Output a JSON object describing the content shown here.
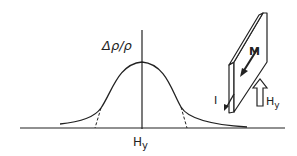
{
  "diagram": {
    "y_axis_label": "Δρ/ρ",
    "x_axis_label": "Hy",
    "x_axis_label_main": "H",
    "x_axis_label_sub": "y",
    "slab_labels": {
      "magnetization": "M",
      "current": "I",
      "field_main": "H",
      "field_sub": "y"
    },
    "colors": {
      "ink": "#222222",
      "background": "#ffffff"
    }
  }
}
